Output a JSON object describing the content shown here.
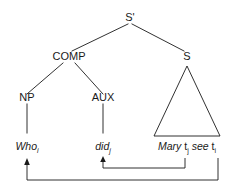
{
  "figure": {
    "type": "syntactic-tree-diagram",
    "background_color": "#ffffff",
    "line_color": "#1a1a1a"
  },
  "nodes": {
    "root": "S'",
    "comp": "COMP",
    "s": "S",
    "np": "NP",
    "aux": "AUX"
  },
  "leaves": {
    "who": {
      "word": "Who",
      "subscript": "i"
    },
    "did": {
      "word": "did",
      "subscript": "j"
    },
    "clause": {
      "subject": "Mary",
      "trace1": "t",
      "trace1_subscript": "j",
      "verb": "see",
      "trace2": "t",
      "trace2_subscript": "i"
    }
  },
  "movement": {
    "arrow1_label": "wh-movement",
    "arrow2_label": "aux-movement"
  }
}
